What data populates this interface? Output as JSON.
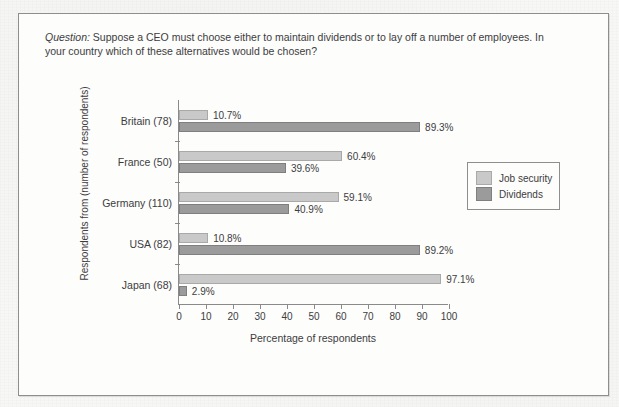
{
  "figure": {
    "question_prefix": "Question:",
    "question_text": " Suppose a CEO must choose either to maintain dividends or to lay off a number of employees. In your country which of these alternatives would be chosen?"
  },
  "chart_data": {
    "type": "bar",
    "orientation": "horizontal",
    "title": "",
    "xlabel": "Percentage of respondents",
    "ylabel": "Respondents from (number of respondents)",
    "xlim": [
      0,
      100
    ],
    "xticks": [
      "0",
      "10",
      "20",
      "30",
      "40",
      "50",
      "60",
      "70",
      "80",
      "90",
      "100"
    ],
    "grid": false,
    "legend_position": "right",
    "categories": [
      "Britain (78)",
      "France (50)",
      "Germany (110)",
      "USA (82)",
      "Japan (68)"
    ],
    "series": [
      {
        "name": "Job security",
        "color": "#c9c9c9",
        "values": [
          10.7,
          60.4,
          59.1,
          10.8,
          97.1
        ],
        "labels": [
          "10.7%",
          "60.4%",
          "59.1%",
          "10.8%",
          "97.1%"
        ]
      },
      {
        "name": "Dividends",
        "color": "#9b9b9b",
        "values": [
          89.3,
          39.6,
          40.9,
          89.2,
          2.9
        ],
        "labels": [
          "89.3%",
          "39.6%",
          "40.9%",
          "89.2%",
          "2.9%"
        ]
      }
    ]
  }
}
